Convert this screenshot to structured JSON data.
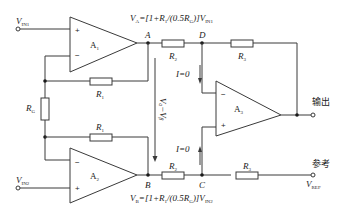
{
  "diagram": {
    "type": "three-op-amp instrumentation amplifier",
    "amplifiers": [
      {
        "id": "A1",
        "label": "A",
        "sub": "1",
        "plus": "+",
        "minus": "−"
      },
      {
        "id": "A2",
        "label": "A",
        "sub": "2",
        "plus": "+",
        "minus": "−"
      },
      {
        "id": "A3",
        "label": "A",
        "sub": "3",
        "plus": "+",
        "minus": "−"
      }
    ],
    "resistors": {
      "r1_top": {
        "label": "R",
        "sub": "1"
      },
      "r1_bottom": {
        "label": "R",
        "sub": "1"
      },
      "rg": {
        "label": "R",
        "sub": "G"
      },
      "r2_top": {
        "label": "R",
        "sub": "2"
      },
      "r2_bottom": {
        "label": "R",
        "sub": "2"
      },
      "r3_top": {
        "label": "R",
        "sub": "3"
      },
      "r3_bottom": {
        "label": "R",
        "sub": "3"
      }
    },
    "nodes": {
      "a": "A",
      "b": "B",
      "c": "C",
      "d": "D"
    },
    "inputs": {
      "in1": {
        "label": "V",
        "sub": "IN1"
      },
      "in2": {
        "label": "V",
        "sub": "IN2"
      },
      "ref": {
        "label": "V",
        "sub": "REF"
      }
    },
    "equations": {
      "va": {
        "lhs": "V",
        "lhs_sub": "A",
        "rhs": "=[1+R",
        "rhs_sub1": "1",
        "mid": "/(0.5R",
        "mid_sub": "G",
        "tail": ")]V",
        "tail_sub": "IN1"
      },
      "vb": {
        "lhs": "V",
        "lhs_sub": "B",
        "rhs": "=[1+R",
        "rhs_sub1": "1",
        "mid": "/(0.5R",
        "mid_sub": "G",
        "tail": ")]V",
        "tail_sub": "IN2"
      },
      "vdiff": "Vₐ−Vᵦ"
    },
    "currents": {
      "top": "I=0",
      "bottom": "I=0"
    },
    "terminals": {
      "output": "输出",
      "reference": "参考"
    }
  }
}
